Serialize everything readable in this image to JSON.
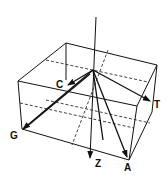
{
  "diagram": {
    "labels": {
      "c": "C",
      "g": "G",
      "t": "T",
      "a": "A",
      "z": "Z"
    },
    "stroke_color": "#111111",
    "background": "#ffffff"
  }
}
